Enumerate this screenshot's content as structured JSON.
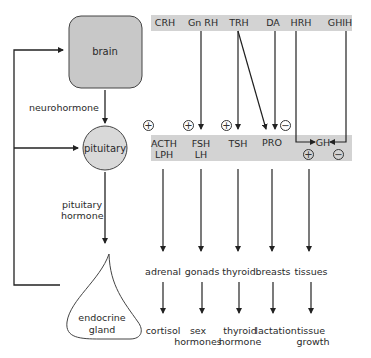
{
  "organs": {
    "brain": "brain",
    "pituitary": "pituitary",
    "gland_line1": "endocrine",
    "gland_line2": "gland"
  },
  "side_labels": {
    "neurohormone": "neurohormone",
    "pituitary_hormone_line1": "pituitary",
    "pituitary_hormone_line2": "hormone"
  },
  "releasing_hormones": [
    "CRH",
    "Gn RH",
    "TRH",
    "DA",
    "HRH",
    "GHIH"
  ],
  "pituitary_hormones": {
    "acth": "ACTH",
    "lph": "LPH",
    "fsh": "FSH",
    "lh": "LH",
    "tsh": "TSH",
    "pro": "PRO",
    "gh": "GH"
  },
  "signs": {
    "plus": "+",
    "minus": "−"
  },
  "targets": [
    "adrenal",
    "gonads",
    "thyroid",
    "breasts",
    "tissues"
  ],
  "effects": [
    {
      "line1": "cortisol",
      "line2": ""
    },
    {
      "line1": "sex",
      "line2": "hormones"
    },
    {
      "line1": "thyroid",
      "line2": "hormone"
    },
    {
      "line1": "lactation",
      "line2": ""
    },
    {
      "line1": "tissue",
      "line2": "growth"
    }
  ],
  "colors": {
    "band": "#d3d3d3",
    "brain_fill": "#c8c8c8",
    "pituitary_fill": "#d9d9d9",
    "line": "#222222"
  }
}
